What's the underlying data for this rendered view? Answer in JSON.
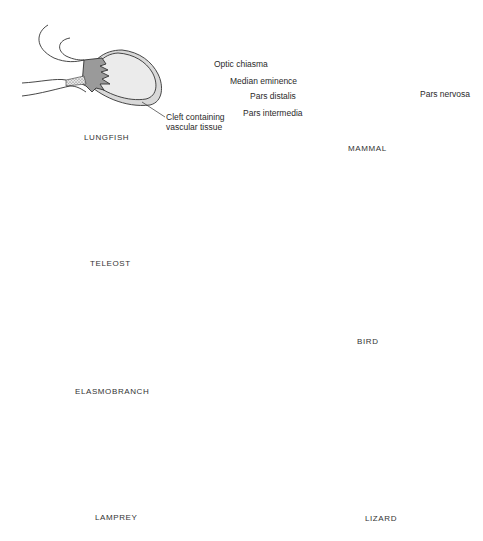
{
  "figure": {
    "colors": {
      "pars_nervosa": "#9a9a9a",
      "pars_distalis": "#d8d8d8",
      "pars_intermedia": "#ebebeb",
      "median_eminence_stipple": "#c8c8c8",
      "outline": "#333333",
      "background": "#ffffff"
    },
    "panels": [
      {
        "id": "lungfish",
        "caption": "LUNGFISH",
        "annotations": [
          {
            "text_line1": "Cleft containing",
            "text_line2": "vascular tissue"
          }
        ]
      },
      {
        "id": "mammal",
        "caption": "MAMMAL",
        "annotations": [
          {
            "text": "Optic chiasma"
          },
          {
            "text": "Median eminence"
          },
          {
            "text": "Pars distalis"
          },
          {
            "text": "Pars intermedia"
          },
          {
            "text": "Pars nervosa"
          }
        ]
      },
      {
        "id": "teleost",
        "caption": "TELEOST",
        "annotations": []
      },
      {
        "id": "bird",
        "caption": "BIRD",
        "annotations": []
      },
      {
        "id": "elasmobranch",
        "caption": "ELASMOBRANCH",
        "annotations": []
      },
      {
        "id": "lamprey",
        "caption": "LAMPREY",
        "annotations": []
      },
      {
        "id": "lizard",
        "caption": "LIZARD",
        "annotations": []
      }
    ]
  }
}
